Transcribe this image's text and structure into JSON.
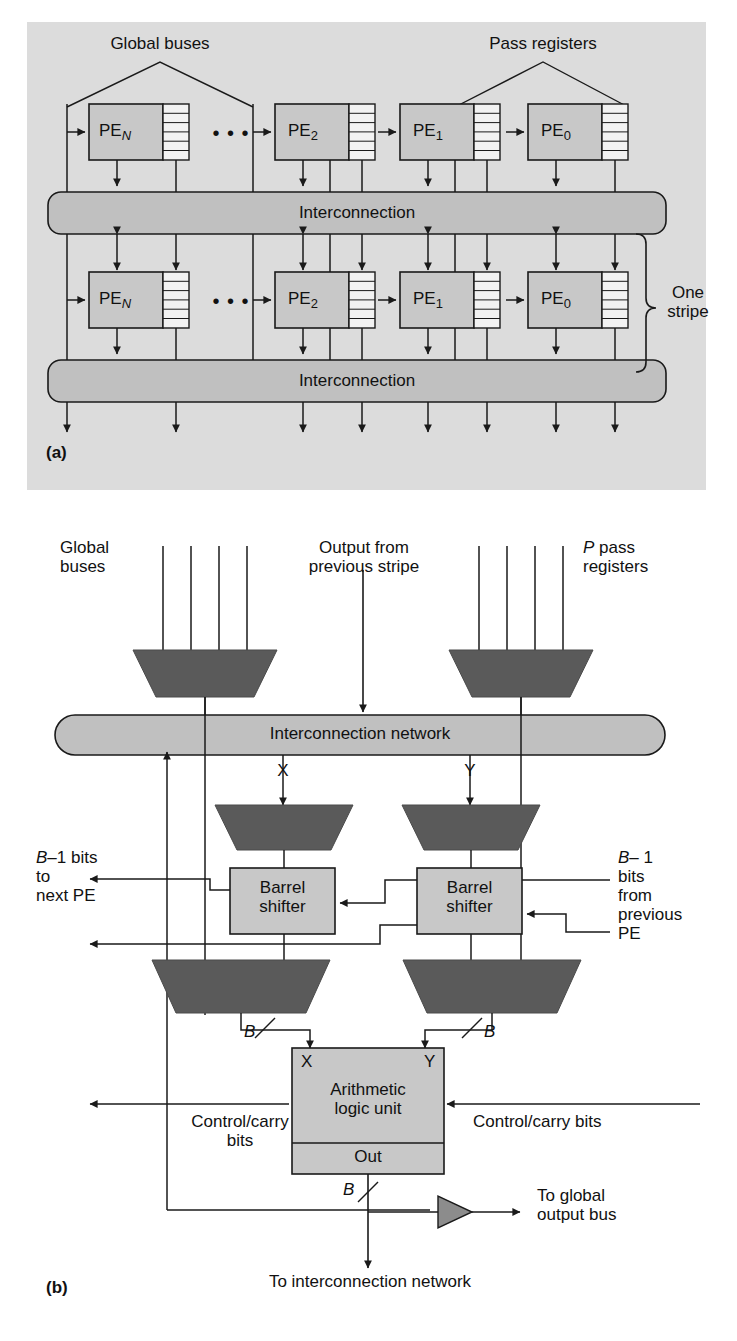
{
  "figure": {
    "panel_a": {
      "key": "(a)",
      "labels": {
        "global_buses": "Global buses",
        "pass_registers": "Pass registers",
        "interconnection": "Interconnection",
        "one_stripe": "One\nstripe",
        "ellipsis": "• • •"
      },
      "rows": [
        {
          "name": "stripe-row-1",
          "pes": [
            {
              "prefix": "PE",
              "subscript": "N"
            },
            {
              "prefix": "PE",
              "subscript": "2"
            },
            {
              "prefix": "PE",
              "subscript": "1"
            },
            {
              "prefix": "PE",
              "subscript": "0"
            }
          ],
          "bus_label": "Interconnection"
        },
        {
          "name": "stripe-row-2",
          "pes": [
            {
              "prefix": "PE",
              "subscript": "N"
            },
            {
              "prefix": "PE",
              "subscript": "2"
            },
            {
              "prefix": "PE",
              "subscript": "1"
            },
            {
              "prefix": "PE",
              "subscript": "0"
            }
          ],
          "bus_label": "Interconnection"
        }
      ],
      "register_rows": 6
    },
    "panel_b": {
      "key": "(b)",
      "labels": {
        "global_buses": "Global\nbuses",
        "output_prev_stripe": "Output from\nprevious stripe",
        "pass_registers": "P pass\nregisters",
        "pass_registers_italic_prefix": "P",
        "pass_registers_rest": " pass\nregisters",
        "interconnection_network": "Interconnection network",
        "x": "X",
        "y": "Y",
        "barrel_shifter_left": "Barrel\nshifter",
        "barrel_shifter_right": "Barrel\nshifter",
        "b_minus_1_to_next_pe": "B–1 bits\nto\nnext PE",
        "b_minus_1_from_prev_pe": "B– 1\nbits\nfrom\nprevious\nPE",
        "bus_width_left": "B",
        "bus_width_right": "B",
        "alu_x": "X",
        "alu_y": "Y",
        "alu_name": "Arithmetic\nlogic unit",
        "alu_out": "Out",
        "control_carry_left": "Control/carry\nbits",
        "control_carry_right": "Control/carry bits",
        "out_bus_width": "B",
        "to_global_output_bus": "To global\noutput bus",
        "to_interconnection_network": "To interconnection network"
      },
      "mux_count_global_buses": 4,
      "mux_count_pass_registers": 4
    },
    "colors": {
      "panel_background": "#dcdcdc",
      "block_fill": "#c8c8c8",
      "mux_fill": "#5a5a5a",
      "line": "#1a1a1a",
      "register_fill": "#f2f2f2",
      "buffer_fill": "#8c8c8c"
    }
  }
}
